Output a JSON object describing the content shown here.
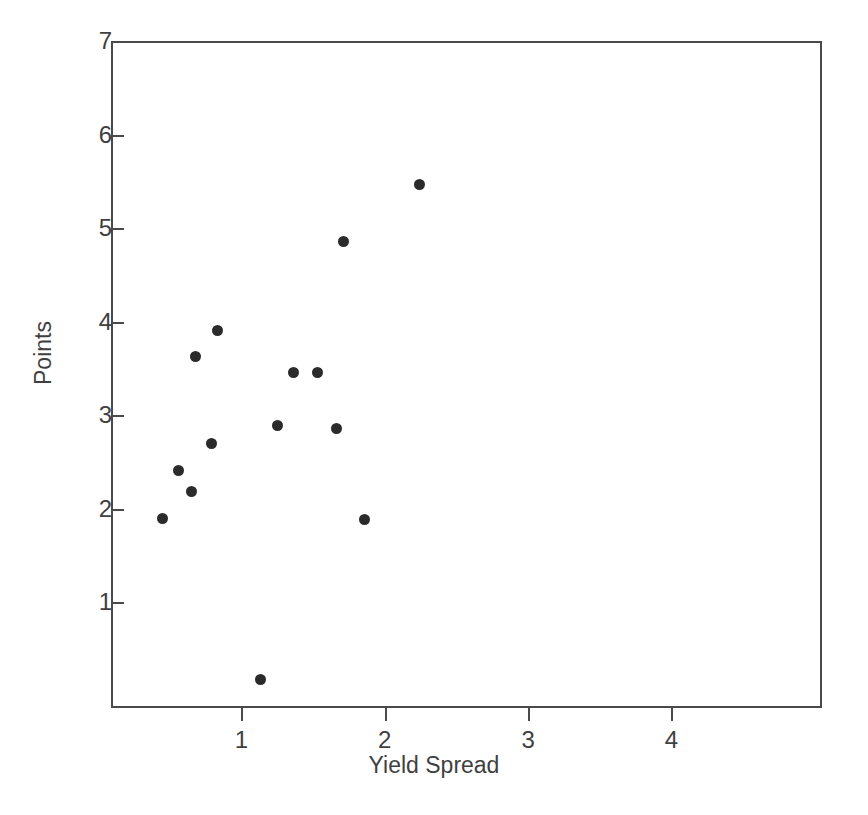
{
  "chart_data": {
    "type": "scatter",
    "title": "",
    "xlabel": "Yield Spread",
    "ylabel": "Points",
    "xlim": [
      0.09,
      5.05
    ],
    "ylim": [
      -0.13,
      7.0
    ],
    "grid": false,
    "legend": null,
    "xticks": [
      1,
      2,
      3,
      4
    ],
    "xticklabels": [
      "1",
      "2",
      "3",
      "4"
    ],
    "yticks": [
      1,
      2,
      3,
      4,
      5,
      6,
      7
    ],
    "yticklabels": [
      "1",
      "2",
      "3",
      "4",
      "5",
      "6",
      "7"
    ],
    "marker": "filled-circle",
    "marker_color": "#2b2b2b",
    "marker_size_px": 11,
    "n_points": 14,
    "points": [
      {
        "x": 0.45,
        "y": 1.9
      },
      {
        "x": 0.56,
        "y": 2.41
      },
      {
        "x": 0.65,
        "y": 2.18
      },
      {
        "x": 0.68,
        "y": 3.63
      },
      {
        "x": 0.79,
        "y": 2.7
      },
      {
        "x": 0.83,
        "y": 3.91
      },
      {
        "x": 1.13,
        "y": 0.17
      },
      {
        "x": 1.25,
        "y": 2.89
      },
      {
        "x": 1.36,
        "y": 3.46
      },
      {
        "x": 1.53,
        "y": 3.46
      },
      {
        "x": 1.66,
        "y": 2.86
      },
      {
        "x": 1.71,
        "y": 4.86
      },
      {
        "x": 1.86,
        "y": 1.88
      },
      {
        "x": 2.24,
        "y": 5.47
      }
    ]
  },
  "style": {
    "background": "#ffffff",
    "axis_color": "#4a4a4a",
    "text_color": "#3f3f3f"
  }
}
